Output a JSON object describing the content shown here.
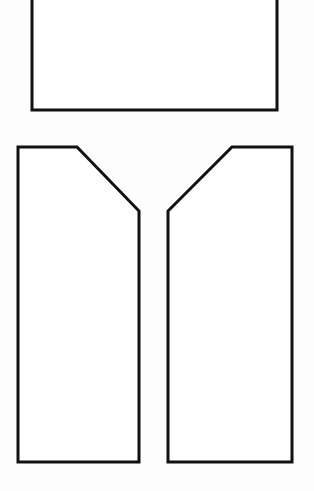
{
  "canvas": {
    "width": 314,
    "height": 491,
    "background_color": "#fdfdfd",
    "title": "Pattern piece line drawing"
  },
  "style": {
    "stroke_color": "#111111",
    "fill_color": "#ffffff",
    "stroke_width": 3
  },
  "shapes": [
    {
      "id": "top-panel",
      "name": "Top rectangular panel",
      "type": "rectangle",
      "note": "Cropped by the top edge of the image; only the lower portion is visible",
      "points": "32,-10 277,-10 277,110 32,110",
      "left": 32,
      "right": 277,
      "top": -10,
      "bottom": 110,
      "width": 245,
      "visible_height": 120
    },
    {
      "id": "left-panel",
      "name": "Left panel with chamfered upper-right corner",
      "type": "polygon",
      "points": "18,147 77,147 139,211 139,462 18,462",
      "left": 18,
      "right": 139,
      "top": 147,
      "bottom": 462,
      "width": 121,
      "height": 315,
      "chamfer_start_x": 77,
      "chamfer_end_y": 211
    },
    {
      "id": "right-panel",
      "name": "Right panel with chamfered upper-left corner",
      "type": "polygon",
      "points": "292,147 292,462 168,462 168,211 232,147",
      "left": 168,
      "right": 292,
      "top": 147,
      "bottom": 462,
      "width": 124,
      "height": 315,
      "chamfer_start_x": 232,
      "chamfer_end_y": 211
    }
  ],
  "layout": {
    "gap_between_lower_panels": 29,
    "gap_top_panel_to_lower_panels": 37
  }
}
